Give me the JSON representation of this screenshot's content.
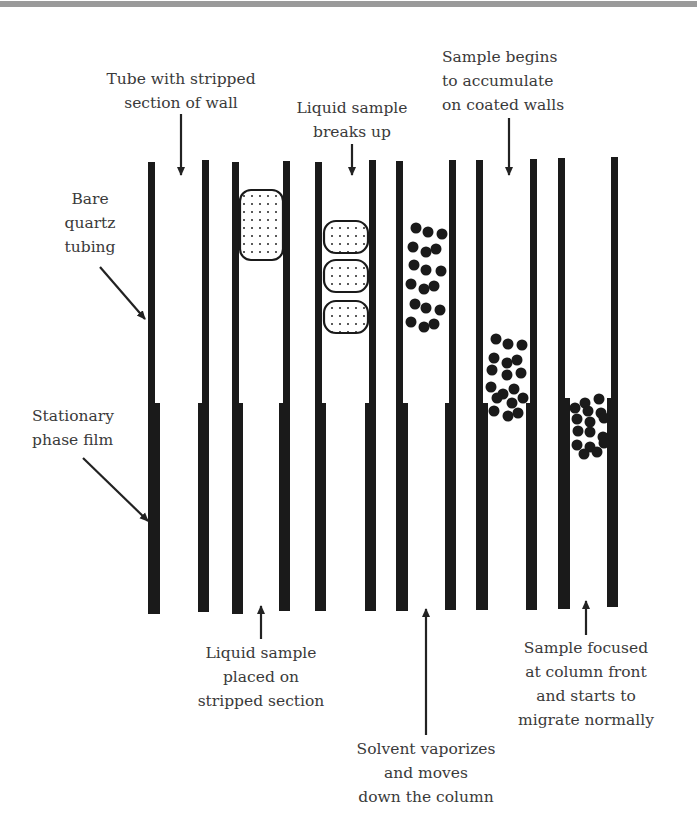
{
  "figure": {
    "colors": {
      "wall": "#1a1a1a",
      "text": "#3a3a3a",
      "top_band": "#9a9a9a",
      "background": "#ffffff"
    }
  },
  "labels": {
    "tube_stripped": {
      "line1": "Tube with stripped",
      "line2": "section of wall"
    },
    "liquid_breaks": {
      "line1": "Liquid sample",
      "line2": "breaks up"
    },
    "sample_accumulate": {
      "line1": "Sample begins",
      "line2": "to accumulate",
      "line3": "on coated walls"
    },
    "bare_quartz": {
      "line1": "Bare",
      "line2": "quartz",
      "line3": "tubing"
    },
    "stationary_phase": {
      "line1": "Stationary",
      "line2": "phase film"
    },
    "liquid_placed": {
      "line1": "Liquid sample",
      "line2": "placed on",
      "line3": "stripped section"
    },
    "solvent_vaporizes": {
      "line1": "Solvent vaporizes",
      "line2": "and moves",
      "line3": "down the column"
    },
    "sample_focused": {
      "line1": "Sample focused",
      "line2": "at column front",
      "line3": "and starts to",
      "line4": "migrate normally"
    }
  },
  "columns": [
    {
      "name": "stripped-tube",
      "stage": 1,
      "content": "empty"
    },
    {
      "name": "liquid-placed",
      "stage": 2,
      "content": "single liquid plug"
    },
    {
      "name": "liquid-breaks-up",
      "stage": 3,
      "content": "three liquid plugs"
    },
    {
      "name": "solvent-vaporizes",
      "stage": 4,
      "content": "dispersed droplets"
    },
    {
      "name": "accumulating",
      "stage": 5,
      "content": "droplets near film start"
    },
    {
      "name": "focused",
      "stage": 6,
      "content": "focused band at column front"
    }
  ]
}
